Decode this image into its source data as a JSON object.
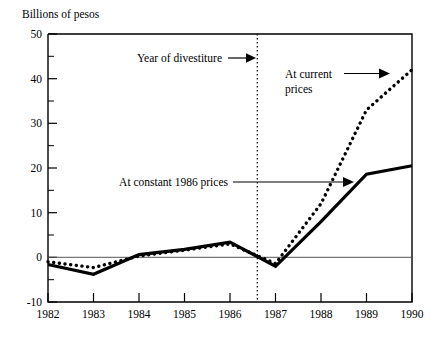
{
  "chart_data": {
    "type": "line",
    "title": "",
    "ylabel": "Billions of pesos",
    "xlabel": "",
    "ylim": [
      -10,
      50
    ],
    "xlim": [
      1982,
      1990
    ],
    "grid": false,
    "legend_position": "inline-annotations",
    "categories": [
      1982,
      1983,
      1984,
      1985,
      1986,
      1987,
      1988,
      1989,
      1990
    ],
    "x_tick_labels": [
      "1982",
      "1983",
      "1984",
      "1985",
      "1986",
      "1987",
      "1988",
      "1989",
      "1990"
    ],
    "y_tick_labels": [
      "50",
      "40",
      "30",
      "20",
      "10",
      "0",
      "-10"
    ],
    "y_major_ticks": [
      50,
      40,
      30,
      20,
      10,
      0,
      -10
    ],
    "y_minor_ticks": [
      45,
      35,
      25,
      15,
      5,
      -5
    ],
    "series": [
      {
        "name": "At constant 1986 prices",
        "style": "solid",
        "values": [
          -1.6,
          -3.8,
          0.6,
          1.8,
          3.4,
          -2.0,
          8.0,
          18.6,
          20.5
        ]
      },
      {
        "name": "At current prices",
        "style": "dotted",
        "values": [
          -1.0,
          -2.3,
          0.3,
          1.6,
          3.0,
          -1.4,
          12.0,
          33.0,
          42.0
        ]
      }
    ],
    "annotations": [
      {
        "id": "year-of-divestiture",
        "text": "Year of divestiture",
        "target_x": 1986.6,
        "target_y": 44.6,
        "arrow": "right"
      },
      {
        "id": "at-current-prices",
        "text_line1": "At current",
        "text_line2": "prices",
        "target_x": 1989.85,
        "target_y": 41.8,
        "arrow": "right"
      },
      {
        "id": "at-constant-1986-prices",
        "text": "At constant 1986  prices",
        "target_x": 1988.6,
        "target_y": 14.6,
        "arrow": "right"
      }
    ],
    "markers": [
      {
        "id": "divestiture-marker",
        "kind": "vertical-dotted-line",
        "x": 1986.6
      }
    ]
  }
}
